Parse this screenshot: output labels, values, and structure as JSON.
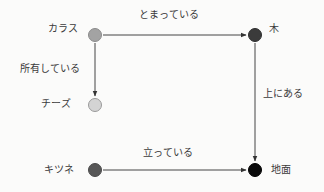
{
  "diagram": {
    "type": "knowledge-graph",
    "nodes": [
      {
        "id": "crow",
        "label": "カラス",
        "x": 95,
        "y": 35,
        "color": "#a3a3a3",
        "border": "#8a8a8a"
      },
      {
        "id": "tree",
        "label": "木",
        "x": 255,
        "y": 35,
        "color": "#3b3b3b",
        "border": "#2e2e2e"
      },
      {
        "id": "cheese",
        "label": "チーズ",
        "x": 95,
        "y": 105,
        "color": "#d4d4d4",
        "border": "#9a9a9a"
      },
      {
        "id": "fox",
        "label": "キツネ",
        "x": 95,
        "y": 170,
        "color": "#575757",
        "border": "#4a4a4a"
      },
      {
        "id": "ground",
        "label": "地面",
        "x": 255,
        "y": 170,
        "color": "#0a0a0a",
        "border": "#000000"
      }
    ],
    "edges": [
      {
        "from": "crow",
        "to": "tree",
        "label": "とまっている"
      },
      {
        "from": "crow",
        "to": "cheese",
        "label": "所有している"
      },
      {
        "from": "tree",
        "to": "ground",
        "label": "上にある"
      },
      {
        "from": "fox",
        "to": "ground",
        "label": "立っている"
      }
    ]
  }
}
